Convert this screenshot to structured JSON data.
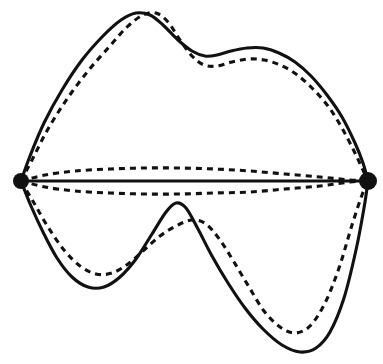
{
  "figure": {
    "background_color": "#ffffff",
    "stroke_color": "#111111",
    "width": 383,
    "height": 364,
    "caption": ""
  },
  "chart_data": {
    "type": "line",
    "xlabel": "",
    "ylabel": "",
    "xlim": [
      0,
      383
    ],
    "ylim": [
      0,
      364
    ],
    "grid": false,
    "legend": "none",
    "annotations": [],
    "nodes": [
      {
        "name": "left-endpoint",
        "x": 21,
        "y": 181,
        "radius": 8,
        "color": "#111111"
      },
      {
        "name": "right-endpoint",
        "x": 368,
        "y": 181,
        "radius": 9,
        "color": "#111111"
      }
    ],
    "series": [
      {
        "name": "upper-solid-boundary",
        "style": "solid",
        "color": "#111111",
        "points": [
          [
            21,
            181
          ],
          [
            30,
            156
          ],
          [
            44,
            123
          ],
          [
            62,
            90
          ],
          [
            82,
            60
          ],
          [
            103,
            36
          ],
          [
            121,
            20
          ],
          [
            136,
            13
          ],
          [
            150,
            15
          ],
          [
            163,
            25
          ],
          [
            178,
            40
          ],
          [
            192,
            51
          ],
          [
            205,
            56
          ],
          [
            217,
            55
          ],
          [
            231,
            51
          ],
          [
            247,
            48
          ],
          [
            263,
            48
          ],
          [
            279,
            53
          ],
          [
            295,
            62
          ],
          [
            311,
            76
          ],
          [
            327,
            95
          ],
          [
            342,
            117
          ],
          [
            355,
            143
          ],
          [
            363,
            163
          ],
          [
            368,
            181
          ]
        ]
      },
      {
        "name": "upper-dashed-boundary",
        "style": "dashed",
        "color": "#111111",
        "points": [
          [
            21,
            181
          ],
          [
            33,
            158
          ],
          [
            48,
            129
          ],
          [
            67,
            99
          ],
          [
            88,
            71
          ],
          [
            109,
            47
          ],
          [
            127,
            27
          ],
          [
            143,
            15
          ],
          [
            156,
            13
          ],
          [
            168,
            22
          ],
          [
            180,
            40
          ],
          [
            192,
            56
          ],
          [
            204,
            65
          ],
          [
            217,
            66
          ],
          [
            232,
            62
          ],
          [
            248,
            59
          ],
          [
            264,
            60
          ],
          [
            280,
            65
          ],
          [
            296,
            74
          ],
          [
            312,
            88
          ],
          [
            328,
            106
          ],
          [
            342,
            128
          ],
          [
            354,
            151
          ],
          [
            362,
            168
          ],
          [
            368,
            181
          ]
        ]
      },
      {
        "name": "upper-inner-dashed-arc",
        "style": "dashed",
        "color": "#111111",
        "points": [
          [
            21,
            181
          ],
          [
            45,
            175
          ],
          [
            75,
            171
          ],
          [
            110,
            169
          ],
          [
            145,
            168
          ],
          [
            180,
            168
          ],
          [
            215,
            169
          ],
          [
            250,
            171
          ],
          [
            285,
            174
          ],
          [
            320,
            177
          ],
          [
            350,
            180
          ],
          [
            368,
            181
          ]
        ]
      },
      {
        "name": "central-solid-axis",
        "style": "solid",
        "color": "#111111",
        "points": [
          [
            21,
            181
          ],
          [
            368,
            181
          ]
        ]
      },
      {
        "name": "lower-inner-dashed-arc",
        "style": "dashed",
        "color": "#111111",
        "points": [
          [
            21,
            181
          ],
          [
            45,
            187
          ],
          [
            75,
            191
          ],
          [
            110,
            193
          ],
          [
            145,
            194
          ],
          [
            180,
            194
          ],
          [
            215,
            193
          ],
          [
            250,
            192
          ],
          [
            285,
            189
          ],
          [
            320,
            186
          ],
          [
            350,
            182
          ],
          [
            368,
            181
          ]
        ]
      },
      {
        "name": "lower-solid-boundary",
        "style": "solid",
        "color": "#111111",
        "points": [
          [
            21,
            181
          ],
          [
            31,
            206
          ],
          [
            43,
            232
          ],
          [
            57,
            258
          ],
          [
            72,
            277
          ],
          [
            88,
            287
          ],
          [
            104,
            287
          ],
          [
            120,
            277
          ],
          [
            136,
            259
          ],
          [
            152,
            234
          ],
          [
            166,
            212
          ],
          [
            176,
            203
          ],
          [
            186,
            208
          ],
          [
            198,
            229
          ],
          [
            212,
            256
          ],
          [
            228,
            283
          ],
          [
            245,
            308
          ],
          [
            263,
            329
          ],
          [
            282,
            345
          ],
          [
            300,
            352
          ],
          [
            316,
            348
          ],
          [
            330,
            332
          ],
          [
            344,
            298
          ],
          [
            356,
            250
          ],
          [
            364,
            208
          ],
          [
            368,
            181
          ]
        ]
      },
      {
        "name": "lower-dashed-boundary",
        "style": "dashed",
        "color": "#111111",
        "points": [
          [
            21,
            181
          ],
          [
            34,
            203
          ],
          [
            48,
            227
          ],
          [
            64,
            250
          ],
          [
            80,
            266
          ],
          [
            96,
            274
          ],
          [
            112,
            273
          ],
          [
            128,
            264
          ],
          [
            144,
            250
          ],
          [
            160,
            236
          ],
          [
            176,
            226
          ],
          [
            192,
            220
          ],
          [
            206,
            224
          ],
          [
            220,
            240
          ],
          [
            234,
            262
          ],
          [
            249,
            287
          ],
          [
            264,
            311
          ],
          [
            280,
            327
          ],
          [
            295,
            333
          ],
          [
            310,
            326
          ],
          [
            325,
            303
          ],
          [
            339,
            268
          ],
          [
            352,
            225
          ],
          [
            362,
            195
          ],
          [
            368,
            181
          ]
        ]
      }
    ]
  }
}
